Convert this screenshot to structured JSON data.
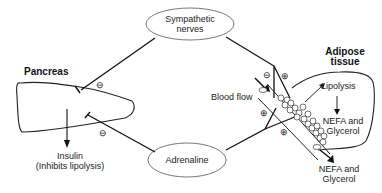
{
  "nodes": {
    "sympathetic": {
      "line1": "Sympathetic",
      "line2": "nerves"
    },
    "adrenaline": {
      "label": "Adrenaline"
    },
    "pancreas": {
      "label": "Pancreas"
    },
    "adipose": {
      "line1": "Adipose",
      "line2": "tissue"
    }
  },
  "labels": {
    "insulin_line1": "Insulin",
    "insulin_line2": "(Inhibits lipolysis)",
    "blood_flow": "Blood flow",
    "lipolysis": "Lipolysis",
    "nefa_in_line1": "NEFA and",
    "nefa_in_line2": "Glycerol",
    "nefa_out_line1": "NEFA and",
    "nefa_out_line2": "Glycerol"
  },
  "signs": {
    "inhibit": "⊖",
    "stimulate": "⊕"
  }
}
